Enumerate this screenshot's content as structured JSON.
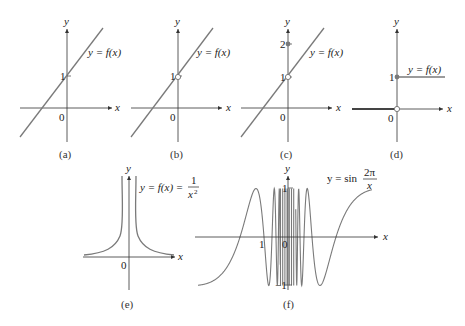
{
  "chart_data": [
    {
      "id": "a",
      "type": "line",
      "caption": "(a)",
      "label": "y = f(x)",
      "axes": {
        "x": "x",
        "y": "y"
      },
      "ticks": {
        "y": [
          "1"
        ],
        "origin": "0"
      },
      "description": "Continuous straight line through (0,1)",
      "points": [
        [
          -1.5,
          -1.0
        ],
        [
          2.6,
          3.6
        ]
      ],
      "special_points": []
    },
    {
      "id": "b",
      "type": "line",
      "caption": "(b)",
      "label": "y = f(x)",
      "axes": {
        "x": "x",
        "y": "y"
      },
      "ticks": {
        "y": [
          "1"
        ],
        "origin": "0"
      },
      "description": "Straight line with a hole (open circle) at (0,1)",
      "special_points": [
        {
          "x": 0,
          "y": 1,
          "style": "open"
        }
      ]
    },
    {
      "id": "c",
      "type": "line",
      "caption": "(c)",
      "label": "y = f(x)",
      "axes": {
        "x": "x",
        "y": "y"
      },
      "ticks": {
        "y": [
          "1",
          "2"
        ],
        "origin": "0"
      },
      "description": "Straight line with a hole at (0,1) and an isolated filled point at (0,2)",
      "special_points": [
        {
          "x": 0,
          "y": 1,
          "style": "open"
        },
        {
          "x": 0,
          "y": 2,
          "style": "filled"
        }
      ]
    },
    {
      "id": "d",
      "type": "line",
      "caption": "(d)",
      "label": "y = f(x)",
      "axes": {
        "x": "x",
        "y": "y"
      },
      "ticks": {
        "y": [
          "1"
        ],
        "origin": "0"
      },
      "description": "Unit step function: y=0 for x<0 (open at origin), y=1 for x>=0 (filled at (0,1))",
      "special_points": [
        {
          "x": 0,
          "y": 0,
          "style": "open"
        },
        {
          "x": 0,
          "y": 1,
          "style": "filled"
        }
      ]
    },
    {
      "id": "e",
      "type": "line",
      "caption": "(e)",
      "label": "y = f(x) = 1/x²",
      "label_parts": {
        "lhs": "y = f(x) =",
        "num": "1",
        "den": "x²"
      },
      "axes": {
        "x": "x",
        "y": "y"
      },
      "ticks": {
        "origin": "0"
      },
      "description": "Graph of 1/x^2 with vertical asymptote at x=0"
    },
    {
      "id": "f",
      "type": "line",
      "caption": "(f)",
      "label": "y = sin 2π/x",
      "label_parts": {
        "lhs": "y = sin",
        "num": "2π",
        "den": "x"
      },
      "axes": {
        "x": "x",
        "y": "y"
      },
      "ticks": {
        "y": [
          "1",
          "−1"
        ],
        "x": [
          "1"
        ],
        "origin": "0"
      },
      "ylim": [
        -1,
        1
      ],
      "description": "Graph of sin(2π/x), oscillating infinitely often near x=0"
    }
  ],
  "labels": {
    "x": "x",
    "y": "y",
    "zero": "0",
    "one": "1",
    "two": "2",
    "neg_one": "−1",
    "fx": "y = f(x)",
    "e_lhs": "y = f(x) =",
    "e_num": "1",
    "e_den": "x",
    "e_exp": "2",
    "f_lhs": "y = sin",
    "f_num": "2π",
    "f_den": "x",
    "cap_a": "(a)",
    "cap_b": "(b)",
    "cap_c": "(c)",
    "cap_d": "(d)",
    "cap_e": "(e)",
    "cap_f": "(f)"
  },
  "colors": {
    "curve": "#7a7a7a",
    "axis": "#333333",
    "text": "#222222"
  }
}
